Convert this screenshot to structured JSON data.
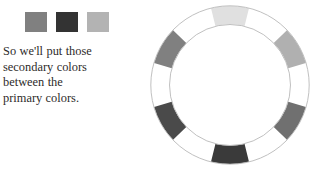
{
  "slide": {
    "background_color": "#ffffff"
  },
  "swatches": {
    "label": "secondary color swatches",
    "items": [
      {
        "name": "swatch-secondary-1",
        "color": "#808080"
      },
      {
        "name": "swatch-secondary-2",
        "color": "#333333"
      },
      {
        "name": "swatch-secondary-3",
        "color": "#b3b3b3"
      }
    ]
  },
  "caption": {
    "full_text": "So we'll put those secondary colors between the primary colors.",
    "lines": [
      "So we'll put those",
      "secondary colors",
      "between the",
      "primary colors."
    ],
    "text_color": "#2e2b2a"
  },
  "color_wheel": {
    "label": "color wheel",
    "segment_count": 12,
    "outline_color": "#b9b9b9",
    "gap_color": "#ffffff",
    "segments": [
      {
        "position": "top",
        "index": 0,
        "angle_deg": 0,
        "color": "#e0e0e0",
        "filled": true
      },
      {
        "position": "top-gap",
        "index": 1,
        "angle_deg": 30,
        "color": "#ffffff",
        "filled": false
      },
      {
        "position": "upper-right",
        "index": 2,
        "angle_deg": 60,
        "color": "#b0b0b0",
        "filled": true
      },
      {
        "position": "right-gap",
        "index": 3,
        "angle_deg": 90,
        "color": "#ffffff",
        "filled": false
      },
      {
        "position": "lower-right",
        "index": 4,
        "angle_deg": 120,
        "color": "#707070",
        "filled": true
      },
      {
        "position": "bottom-gap",
        "index": 5,
        "angle_deg": 150,
        "color": "#ffffff",
        "filled": false
      },
      {
        "position": "bottom",
        "index": 6,
        "angle_deg": 180,
        "color": "#3a3a3a",
        "filled": true
      },
      {
        "position": "bottom-gap-2",
        "index": 7,
        "angle_deg": 210,
        "color": "#ffffff",
        "filled": false
      },
      {
        "position": "lower-left",
        "index": 8,
        "angle_deg": 240,
        "color": "#4a4a4a",
        "filled": true
      },
      {
        "position": "left-gap",
        "index": 9,
        "angle_deg": 270,
        "color": "#ffffff",
        "filled": false
      },
      {
        "position": "upper-left",
        "index": 10,
        "angle_deg": 300,
        "color": "#808080",
        "filled": true
      },
      {
        "position": "top-gap-2",
        "index": 11,
        "angle_deg": 330,
        "color": "#ffffff",
        "filled": false
      }
    ]
  }
}
